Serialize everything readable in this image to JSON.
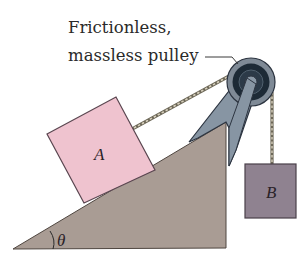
{
  "diagram": {
    "callout": {
      "line1": "Frictionless,",
      "line2": "massless pulley"
    },
    "block_a": {
      "label": "A",
      "color": "#efc3cf",
      "edge_color": "#5a4650"
    },
    "block_b": {
      "label": "B",
      "color": "#8f8290",
      "edge_color": "#4a404a"
    },
    "incline": {
      "angle_label": "θ",
      "color": "#a99c94"
    },
    "pulley": {
      "outer_color": "#7f8a96",
      "inner_color": "#1d2a36",
      "hub_color": "#8a98a6",
      "bracket_color": "#8795a3"
    },
    "rope_color": "#9c9686"
  }
}
